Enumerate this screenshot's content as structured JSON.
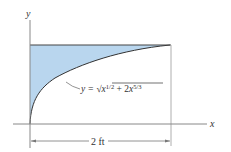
{
  "diagram": {
    "axis_labels": {
      "x": "x",
      "y": "y"
    },
    "equation": {
      "lhs": "y = ",
      "radical": "√",
      "term1_base": "x",
      "term1_exp": "1/2",
      "plus": " + 2",
      "term2_base": "x",
      "term2_exp": "5/3"
    },
    "dimension": "2 ft",
    "colors": {
      "fill": "#b9d6ee",
      "line": "#4a4a4a",
      "axis": "#888888"
    }
  }
}
